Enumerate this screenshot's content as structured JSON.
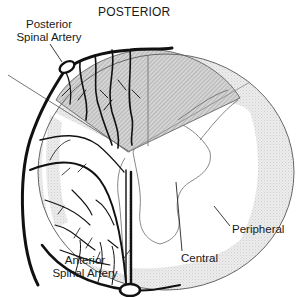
{
  "diagram": {
    "title": "POSTERIOR",
    "labels": {
      "posterior_artery_line1": "Posterior",
      "posterior_artery_line2": "Spinal Artery",
      "anterior_artery_line1": "Anterior",
      "anterior_artery_line2": "Spinal Artery",
      "central": "Central",
      "peripheral": "Peripheral"
    },
    "regions": [
      {
        "name": "posterior-sector",
        "fill": "hatched gray"
      },
      {
        "name": "peripheral-zone",
        "fill": "light dotted gray"
      },
      {
        "name": "central-zone",
        "fill": "white"
      }
    ],
    "colors": {
      "vessel": "#111111",
      "outline": "#555555",
      "hatch": "#b8b8b8",
      "stipple": "#e2e2e2",
      "text": "#1a1a1a"
    }
  }
}
